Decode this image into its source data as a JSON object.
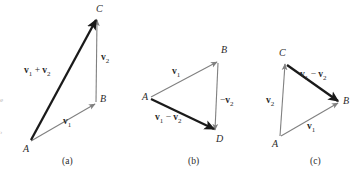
{
  "figure": {
    "kind": "vector-addition-subtraction-triangle-diagrams",
    "background_color": "#ffffff",
    "thick_arrow_color": "#1a1a1a",
    "thin_arrow_color": "#808080",
    "label_color": "#2b2b2b"
  },
  "panels": [
    {
      "id": "a",
      "caption": "(a)",
      "caption_pos": {
        "x": 62,
        "y": 156
      },
      "points": [
        {
          "name": "A",
          "label": "A",
          "x": 30,
          "y": 142,
          "label_x": 23,
          "label_y": 144
        },
        {
          "name": "B",
          "label": "B",
          "x": 96,
          "y": 103,
          "label_x": 100,
          "label_y": 94
        },
        {
          "name": "C",
          "label": "C",
          "x": 97,
          "y": 19,
          "label_x": 96,
          "label_y": 4
        }
      ],
      "arrows": [
        {
          "name": "v1",
          "from": "A",
          "to": "B",
          "weight": "thin",
          "x1": 31,
          "y1": 141,
          "x2": 95,
          "y2": 104
        },
        {
          "name": "v2",
          "from": "B",
          "to": "C",
          "weight": "thin",
          "x1": 96,
          "y1": 102,
          "x2": 97,
          "y2": 20
        },
        {
          "name": "v1+v2",
          "from": "A",
          "to": "C",
          "weight": "thick",
          "x1": 31,
          "y1": 140,
          "x2": 96,
          "y2": 20
        }
      ],
      "labels": [
        {
          "name": "v1-plus-v2-label",
          "text": "v1 + v2",
          "x": 24,
          "y": 66
        },
        {
          "name": "v2-label",
          "text": "v2",
          "x": 101,
          "y": 53
        },
        {
          "name": "v1-label",
          "text": "v1",
          "x": 63,
          "y": 117
        }
      ]
    },
    {
      "id": "b",
      "caption": "(b)",
      "caption_pos": {
        "x": 188,
        "y": 156
      },
      "points": [
        {
          "name": "A",
          "label": "A",
          "x": 150,
          "y": 98,
          "label_x": 142,
          "label_y": 92
        },
        {
          "name": "B",
          "label": "B",
          "x": 218,
          "y": 61,
          "label_x": 221,
          "label_y": 45
        },
        {
          "name": "D",
          "label": "D",
          "x": 215,
          "y": 131,
          "label_x": 216,
          "label_y": 134
        }
      ],
      "arrows": [
        {
          "name": "v1",
          "from": "A",
          "to": "B",
          "weight": "thin",
          "x1": 151,
          "y1": 97,
          "x2": 217,
          "y2": 62
        },
        {
          "name": "-v2",
          "from": "B",
          "to": "D",
          "weight": "thin",
          "x1": 218,
          "y1": 63,
          "x2": 215,
          "y2": 130
        },
        {
          "name": "v1-v2",
          "from": "A",
          "to": "D",
          "weight": "thick",
          "x1": 151,
          "y1": 99,
          "x2": 214,
          "y2": 129
        }
      ],
      "labels": [
        {
          "name": "v1-label",
          "text": "v1",
          "x": 172,
          "y": 67
        },
        {
          "name": "minus-v2-label",
          "text": "-v2",
          "x": 220,
          "y": 96
        },
        {
          "name": "v1-minus-v2-label",
          "text": "v1 - v2",
          "x": 155,
          "y": 113
        }
      ]
    },
    {
      "id": "c",
      "caption": "(c)",
      "caption_pos": {
        "x": 310,
        "y": 156
      },
      "points": [
        {
          "name": "C",
          "label": "C",
          "x": 285,
          "y": 63,
          "label_x": 279,
          "label_y": 48
        },
        {
          "name": "B",
          "label": "B",
          "x": 339,
          "y": 102,
          "label_x": 343,
          "label_y": 96
        },
        {
          "name": "A",
          "label": "A",
          "x": 279,
          "y": 137,
          "label_x": 272,
          "label_y": 139
        }
      ],
      "arrows": [
        {
          "name": "v2",
          "from": "A",
          "to": "C",
          "weight": "thin",
          "x1": 280,
          "y1": 136,
          "x2": 285,
          "y2": 64
        },
        {
          "name": "v1",
          "from": "A",
          "to": "B",
          "weight": "thin",
          "x1": 281,
          "y1": 136,
          "x2": 338,
          "y2": 103
        },
        {
          "name": "v1-v2",
          "from": "C",
          "to": "B",
          "weight": "thick",
          "x1": 287,
          "y1": 65,
          "x2": 338,
          "y2": 101
        }
      ],
      "labels": [
        {
          "name": "v1-minus-v2-label",
          "text": "v1 - v2",
          "x": 300,
          "y": 70
        },
        {
          "name": "v2-label",
          "text": "v2",
          "x": 266,
          "y": 96
        },
        {
          "name": "v1-label",
          "text": "v1",
          "x": 307,
          "y": 122
        }
      ]
    }
  ],
  "edge_artifacts": [
    {
      "name": "left-edge-mark",
      "text": "›",
      "x": 0,
      "y": 128
    },
    {
      "name": "left-edge-mark-c",
      "text": "e",
      "x": 0,
      "y": 96
    }
  ]
}
